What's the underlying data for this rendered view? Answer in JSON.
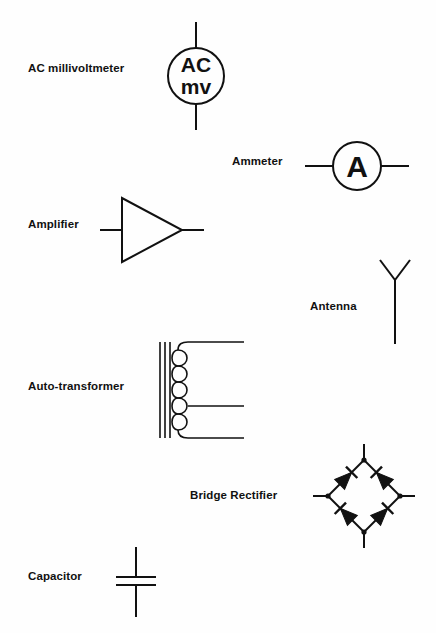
{
  "document": {
    "kind": "electrical-symbols-reference-sheet",
    "background_color": "#fefefe",
    "ink_color": "#111111",
    "width": 436,
    "height": 633
  },
  "symbols": [
    {
      "id": "ac-millivoltmeter",
      "label": "AC millivoltmeter",
      "label_x": 28,
      "label_y": 62,
      "glyph_text_top": "AC",
      "glyph_text_bottom": "mv",
      "shape": "circle-with-vertical-leads"
    },
    {
      "id": "ammeter",
      "label": "Ammeter",
      "label_x": 232,
      "label_y": 155,
      "glyph_text": "A",
      "shape": "circle-with-horizontal-leads"
    },
    {
      "id": "amplifier",
      "label": "Amplifier",
      "label_x": 28,
      "label_y": 218,
      "shape": "right-pointing-triangle"
    },
    {
      "id": "antenna",
      "label": "Antenna",
      "label_x": 310,
      "label_y": 300,
      "shape": "vertical-mast-with-v-top"
    },
    {
      "id": "auto-transformer",
      "label": "Auto-transformer",
      "label_x": 28,
      "label_y": 380,
      "shape": "core-with-coil-and-taps",
      "coil_turns": 5,
      "core_lines": 3,
      "taps": 3
    },
    {
      "id": "bridge-rectifier",
      "label": "Bridge Rectifier",
      "label_x": 190,
      "label_y": 489,
      "shape": "diamond-of-four-diodes",
      "diode_count": 4
    },
    {
      "id": "capacitor",
      "label": "Capacitor",
      "label_x": 28,
      "label_y": 570,
      "shape": "two-parallel-plates-vertical-leads"
    }
  ]
}
